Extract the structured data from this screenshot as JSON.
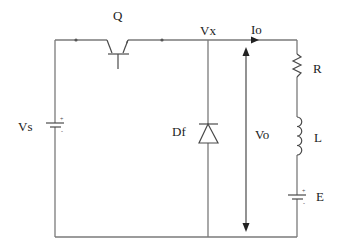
{
  "diagram": {
    "type": "circuit-schematic",
    "colors": {
      "wire": "#7a7a7a",
      "component": "#4a4a4a",
      "text": "#222222",
      "background": "#ffffff"
    },
    "labels": {
      "source": "Vs",
      "switch": "Q",
      "node": "Vx",
      "current": "Io",
      "diode": "Df",
      "output_voltage": "Vo",
      "resistor": "R",
      "inductor": "L",
      "back_emf": "E"
    },
    "polarity": {
      "vs_plus": "+",
      "vs_minus": "-",
      "e_plus": "+",
      "e_minus": "-"
    },
    "components": [
      {
        "id": "Vs",
        "kind": "dc-source",
        "position": "left branch"
      },
      {
        "id": "Q",
        "kind": "transistor-switch",
        "position": "top wire"
      },
      {
        "id": "Df",
        "kind": "diode",
        "position": "middle branch, cathode up"
      },
      {
        "id": "R",
        "kind": "resistor",
        "position": "right branch top"
      },
      {
        "id": "L",
        "kind": "inductor",
        "position": "right branch middle"
      },
      {
        "id": "E",
        "kind": "dc-source",
        "position": "right branch bottom"
      }
    ]
  }
}
